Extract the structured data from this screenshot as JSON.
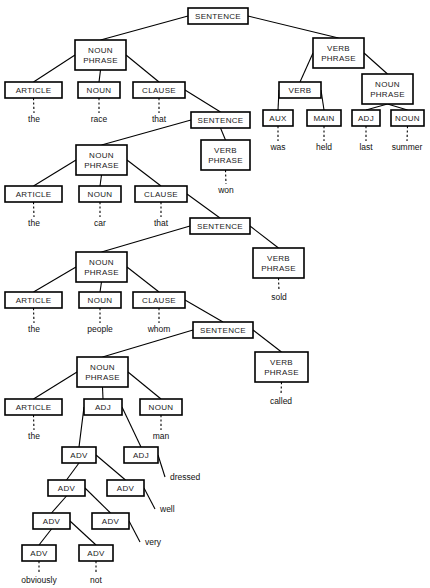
{
  "diagram": {
    "kind": "syntax-tree",
    "colors": {
      "background": "#ffffff",
      "box_stroke": "#000000",
      "box_fill": "#ffffff",
      "edge": "#000000",
      "text": "#1a1a1a"
    },
    "nodes": [
      {
        "id": "s1",
        "label": "SENTENCE",
        "lines": [
          "SENTENCE"
        ],
        "x": 188,
        "y": 8,
        "w": 60,
        "h": 16
      },
      {
        "id": "np1",
        "label": "NOUN PHRASE",
        "lines": [
          "NOUN",
          "PHRASE"
        ],
        "x": 75,
        "y": 40,
        "w": 51,
        "h": 30
      },
      {
        "id": "vp1",
        "label": "VERB PHRASE",
        "lines": [
          "VERB",
          "PHRASE"
        ],
        "x": 313,
        "y": 38,
        "w": 51,
        "h": 30
      },
      {
        "id": "art1",
        "label": "ARTICLE",
        "lines": [
          "ARTICLE"
        ],
        "x": 5,
        "y": 82,
        "w": 57,
        "h": 16
      },
      {
        "id": "n1",
        "label": "NOUN",
        "lines": [
          "NOUN"
        ],
        "x": 78,
        "y": 82,
        "w": 42,
        "h": 16
      },
      {
        "id": "cl1",
        "label": "CLAUSE",
        "lines": [
          "CLAUSE"
        ],
        "x": 133,
        "y": 82,
        "w": 52,
        "h": 16
      },
      {
        "id": "verb1",
        "label": "VERB",
        "lines": [
          "VERB"
        ],
        "x": 279,
        "y": 82,
        "w": 42,
        "h": 16
      },
      {
        "id": "np2",
        "label": "NOUN PHRASE",
        "lines": [
          "NOUN",
          "PHRASE"
        ],
        "x": 362,
        "y": 74,
        "w": 51,
        "h": 30
      },
      {
        "id": "aux1",
        "label": "AUX",
        "lines": [
          "AUX"
        ],
        "x": 263,
        "y": 110,
        "w": 30,
        "h": 16
      },
      {
        "id": "main1",
        "label": "MAIN",
        "lines": [
          "MAIN"
        ],
        "x": 307,
        "y": 110,
        "w": 34,
        "h": 16
      },
      {
        "id": "adj0",
        "label": "ADJ",
        "lines": [
          "ADJ"
        ],
        "x": 352,
        "y": 110,
        "w": 28,
        "h": 16
      },
      {
        "id": "n2",
        "label": "NOUN",
        "lines": [
          "NOUN"
        ],
        "x": 391,
        "y": 110,
        "w": 33,
        "h": 16
      },
      {
        "id": "s2",
        "label": "SENTENCE",
        "lines": [
          "SENTENCE"
        ],
        "x": 191,
        "y": 112,
        "w": 59,
        "h": 16
      },
      {
        "id": "vp2",
        "label": "VERB PHRASE",
        "lines": [
          "VERB",
          "PHRASE"
        ],
        "x": 201,
        "y": 140,
        "w": 49,
        "h": 30
      },
      {
        "id": "np3",
        "label": "NOUN PHRASE",
        "lines": [
          "NOUN",
          "PHRASE"
        ],
        "x": 76,
        "y": 145,
        "w": 51,
        "h": 30
      },
      {
        "id": "art2",
        "label": "ARTICLE",
        "lines": [
          "ARTICLE"
        ],
        "x": 5,
        "y": 186,
        "w": 57,
        "h": 16
      },
      {
        "id": "n3",
        "label": "NOUN",
        "lines": [
          "NOUN"
        ],
        "x": 79,
        "y": 186,
        "w": 42,
        "h": 16
      },
      {
        "id": "cl2",
        "label": "CLAUSE",
        "lines": [
          "CLAUSE"
        ],
        "x": 135,
        "y": 186,
        "w": 52,
        "h": 16
      },
      {
        "id": "s3",
        "label": "SENTENCE",
        "lines": [
          "SENTENCE"
        ],
        "x": 190,
        "y": 218,
        "w": 60,
        "h": 16
      },
      {
        "id": "vp3",
        "label": "VERB PHRASE",
        "lines": [
          "VERB",
          "PHRASE"
        ],
        "x": 253,
        "y": 248,
        "w": 51,
        "h": 30
      },
      {
        "id": "np4",
        "label": "NOUN PHRASE",
        "lines": [
          "NOUN",
          "PHRASE"
        ],
        "x": 76,
        "y": 252,
        "w": 51,
        "h": 30
      },
      {
        "id": "art3",
        "label": "ARTICLE",
        "lines": [
          "ARTICLE"
        ],
        "x": 5,
        "y": 292,
        "w": 57,
        "h": 16
      },
      {
        "id": "n4",
        "label": "NOUN",
        "lines": [
          "NOUN"
        ],
        "x": 79,
        "y": 292,
        "w": 42,
        "h": 16
      },
      {
        "id": "cl3",
        "label": "CLAUSE",
        "lines": [
          "CLAUSE"
        ],
        "x": 133,
        "y": 292,
        "w": 52,
        "h": 16
      },
      {
        "id": "s4",
        "label": "SENTENCE",
        "lines": [
          "SENTENCE"
        ],
        "x": 193,
        "y": 322,
        "w": 60,
        "h": 16
      },
      {
        "id": "vp4",
        "label": "VERB PHRASE",
        "lines": [
          "VERB",
          "PHRASE"
        ],
        "x": 255,
        "y": 352,
        "w": 53,
        "h": 30
      },
      {
        "id": "np5",
        "label": "NOUN PHRASE",
        "lines": [
          "NOUN",
          "PHRASE"
        ],
        "x": 77,
        "y": 357,
        "w": 51,
        "h": 30
      },
      {
        "id": "art4",
        "label": "ARTICLE",
        "lines": [
          "ARTICLE"
        ],
        "x": 5,
        "y": 399,
        "w": 57,
        "h": 16
      },
      {
        "id": "adj1",
        "label": "ADJ",
        "lines": [
          "ADJ"
        ],
        "x": 84,
        "y": 399,
        "w": 38,
        "h": 16
      },
      {
        "id": "n5",
        "label": "NOUN",
        "lines": [
          "NOUN"
        ],
        "x": 140,
        "y": 399,
        "w": 42,
        "h": 16
      },
      {
        "id": "adv1",
        "label": "ADV",
        "lines": [
          "ADV"
        ],
        "x": 62,
        "y": 447,
        "w": 34,
        "h": 16
      },
      {
        "id": "adj2",
        "label": "ADJ",
        "lines": [
          "ADJ"
        ],
        "x": 124,
        "y": 447,
        "w": 34,
        "h": 16
      },
      {
        "id": "adv2",
        "label": "ADV",
        "lines": [
          "ADV"
        ],
        "x": 48,
        "y": 480,
        "w": 37,
        "h": 16
      },
      {
        "id": "adv3",
        "label": "ADV",
        "lines": [
          "ADV"
        ],
        "x": 107,
        "y": 480,
        "w": 37,
        "h": 16
      },
      {
        "id": "adv4",
        "label": "ADV",
        "lines": [
          "ADV"
        ],
        "x": 33,
        "y": 513,
        "w": 37,
        "h": 16
      },
      {
        "id": "adv5",
        "label": "ADV",
        "lines": [
          "ADV"
        ],
        "x": 92,
        "y": 513,
        "w": 37,
        "h": 16
      },
      {
        "id": "adv6",
        "label": "ADV",
        "lines": [
          "ADV"
        ],
        "x": 22,
        "y": 545,
        "w": 34,
        "h": 16
      },
      {
        "id": "adv7",
        "label": "ADV",
        "lines": [
          "ADV"
        ],
        "x": 79,
        "y": 545,
        "w": 34,
        "h": 16
      }
    ],
    "edges": [
      {
        "from": "s1",
        "to": "np1"
      },
      {
        "from": "s1",
        "to": "vp1"
      },
      {
        "from": "np1",
        "to": "art1"
      },
      {
        "from": "np1",
        "to": "n1"
      },
      {
        "from": "np1",
        "to": "cl1"
      },
      {
        "from": "vp1",
        "to": "verb1"
      },
      {
        "from": "vp1",
        "to": "np2"
      },
      {
        "from": "verb1",
        "to": "aux1"
      },
      {
        "from": "verb1",
        "to": "main1"
      },
      {
        "from": "np2",
        "to": "adj0"
      },
      {
        "from": "np2",
        "to": "n2"
      },
      {
        "from": "cl1",
        "to": "s2"
      },
      {
        "from": "s2",
        "to": "np3"
      },
      {
        "from": "s2",
        "to": "vp2"
      },
      {
        "from": "np3",
        "to": "art2"
      },
      {
        "from": "np3",
        "to": "n3"
      },
      {
        "from": "np3",
        "to": "cl2"
      },
      {
        "from": "cl2",
        "to": "s3"
      },
      {
        "from": "s3",
        "to": "np4"
      },
      {
        "from": "s3",
        "to": "vp3"
      },
      {
        "from": "np4",
        "to": "art3"
      },
      {
        "from": "np4",
        "to": "n4"
      },
      {
        "from": "np4",
        "to": "cl3"
      },
      {
        "from": "cl3",
        "to": "s4"
      },
      {
        "from": "s4",
        "to": "np5"
      },
      {
        "from": "s4",
        "to": "vp4"
      },
      {
        "from": "np5",
        "to": "art4"
      },
      {
        "from": "np5",
        "to": "adj1"
      },
      {
        "from": "np5",
        "to": "n5"
      },
      {
        "from": "adj1",
        "to": "adv1"
      },
      {
        "from": "adj1",
        "to": "adj2"
      },
      {
        "from": "adv1",
        "to": "adv2"
      },
      {
        "from": "adv1",
        "to": "adv3"
      },
      {
        "from": "adv2",
        "to": "adv4"
      },
      {
        "from": "adv2",
        "to": "adv5"
      },
      {
        "from": "adv4",
        "to": "adv6"
      },
      {
        "from": "adv4",
        "to": "adv7"
      }
    ],
    "terminals": [
      {
        "id": "t-the-1",
        "word": "the",
        "parent": "art1",
        "x": 34,
        "y": 122,
        "style": "stem"
      },
      {
        "id": "t-race",
        "word": "race",
        "parent": "n1",
        "x": 99,
        "y": 122,
        "style": "stem"
      },
      {
        "id": "t-that-1",
        "word": "that",
        "parent": "cl1",
        "x": 159,
        "y": 122,
        "style": "stem"
      },
      {
        "id": "t-was",
        "word": "was",
        "parent": "aux1",
        "x": 278,
        "y": 150,
        "style": "stem"
      },
      {
        "id": "t-held",
        "word": "held",
        "parent": "main1",
        "x": 324,
        "y": 150,
        "style": "stem"
      },
      {
        "id": "t-last",
        "word": "last",
        "parent": "adj0",
        "x": 366,
        "y": 150,
        "style": "stem"
      },
      {
        "id": "t-summer",
        "word": "summer",
        "parent": "n2",
        "x": 407,
        "y": 150,
        "style": "stem"
      },
      {
        "id": "t-won",
        "word": "won",
        "parent": "vp2",
        "x": 226,
        "y": 193,
        "style": "stem"
      },
      {
        "id": "t-the-2",
        "word": "the",
        "parent": "art2",
        "x": 34,
        "y": 226,
        "style": "stem"
      },
      {
        "id": "t-car",
        "word": "car",
        "parent": "n3",
        "x": 100,
        "y": 226,
        "style": "stem"
      },
      {
        "id": "t-that-2",
        "word": "that",
        "parent": "cl2",
        "x": 161,
        "y": 226,
        "style": "stem"
      },
      {
        "id": "t-sold",
        "word": "sold",
        "parent": "vp3",
        "x": 279,
        "y": 300,
        "style": "stem"
      },
      {
        "id": "t-the-3",
        "word": "the",
        "parent": "art3",
        "x": 34,
        "y": 332,
        "style": "stem"
      },
      {
        "id": "t-people",
        "word": "people",
        "parent": "n4",
        "x": 100,
        "y": 332,
        "style": "stem"
      },
      {
        "id": "t-whom",
        "word": "whom",
        "parent": "cl3",
        "x": 159,
        "y": 332,
        "style": "stem"
      },
      {
        "id": "t-called",
        "word": "called",
        "parent": "vp4",
        "x": 281,
        "y": 404,
        "style": "stem"
      },
      {
        "id": "t-the-4",
        "word": "the",
        "parent": "art4",
        "x": 34,
        "y": 439,
        "style": "stem"
      },
      {
        "id": "t-man",
        "word": "man",
        "parent": "n5",
        "x": 161,
        "y": 439,
        "style": "stem"
      },
      {
        "id": "t-dressed",
        "word": "dressed",
        "parent": "adj2",
        "x": 170,
        "y": 480,
        "style": "diagonal"
      },
      {
        "id": "t-well",
        "word": "well",
        "parent": "adv3",
        "x": 160,
        "y": 512,
        "style": "diagonal"
      },
      {
        "id": "t-very",
        "word": "very",
        "parent": "adv5",
        "x": 145,
        "y": 545,
        "style": "diagonal"
      },
      {
        "id": "t-obviously",
        "word": "obviously",
        "parent": "adv6",
        "x": 39,
        "y": 583,
        "style": "stem"
      },
      {
        "id": "t-not",
        "word": "not",
        "parent": "adv7",
        "x": 96,
        "y": 583,
        "style": "stem"
      }
    ],
    "sentence_text": "the race that the car that the people whom obviously not very well dressed man called sold won was held last summer"
  }
}
